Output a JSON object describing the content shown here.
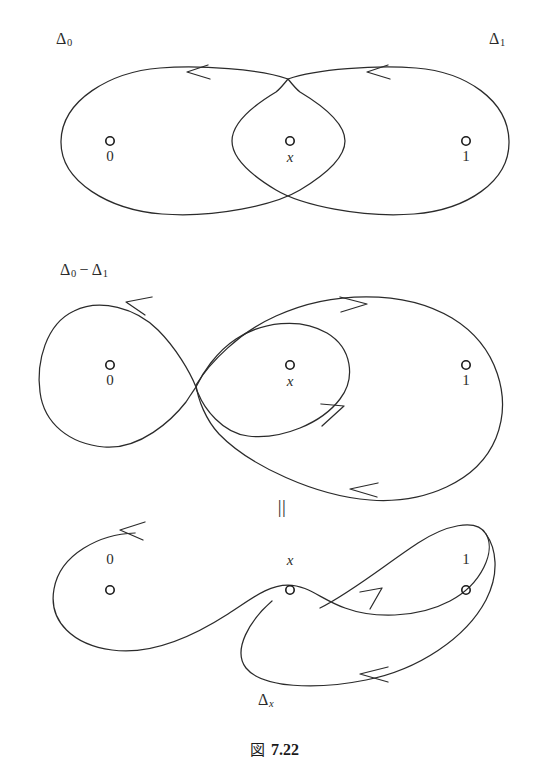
{
  "figure": {
    "caption_word": "図",
    "caption_number": "7.22",
    "equals_symbol": "||",
    "panels": [
      {
        "id": "top",
        "name": "two-overlapping-loops",
        "labels": [
          {
            "name": "delta-0-label",
            "text": "Δ",
            "sub": "0",
            "sub_italic": false,
            "x": 56,
            "y": 31
          },
          {
            "name": "delta-1-label",
            "text": "Δ",
            "sub": "1",
            "sub_italic": false,
            "x": 489,
            "y": 31
          }
        ],
        "points": [
          {
            "name": "point-0",
            "label": "0",
            "italic": false,
            "cx": 110,
            "cy": 141,
            "label_x": 110,
            "label_y": 149
          },
          {
            "name": "point-x",
            "label": "x",
            "italic": true,
            "cx": 290,
            "cy": 141,
            "label_x": 290,
            "label_y": 150
          },
          {
            "name": "point-1",
            "label": "1",
            "italic": false,
            "cx": 466,
            "cy": 141,
            "label_x": 466,
            "label_y": 149
          }
        ]
      },
      {
        "id": "middle",
        "name": "figure-eight-with-outer-loop",
        "labels": [
          {
            "name": "delta-0-minus-delta-1-label",
            "text": "Δ",
            "sub": "0",
            "minus": "−",
            "text2": "Δ",
            "sub2": "1",
            "x": 60,
            "y": 262
          }
        ],
        "points": [
          {
            "name": "point-0",
            "label": "0",
            "italic": false,
            "cx": 110,
            "cy": 365,
            "label_x": 110,
            "label_y": 373
          },
          {
            "name": "point-x",
            "label": "x",
            "italic": true,
            "cx": 290,
            "cy": 365,
            "label_x": 290,
            "label_y": 374
          },
          {
            "name": "point-1",
            "label": "1",
            "italic": false,
            "cx": 466,
            "cy": 365,
            "label_x": 466,
            "label_y": 373
          }
        ]
      },
      {
        "id": "bottom",
        "name": "single-lemniscate-loop",
        "labels": [
          {
            "name": "delta-x-label",
            "text": "Δ",
            "sub": "x",
            "sub_italic": true,
            "x": 258,
            "y": 692
          }
        ],
        "points": [
          {
            "name": "point-0",
            "label": "0",
            "italic": false,
            "cx": 110,
            "cy": 590,
            "label_x": 110,
            "label_y": 552
          },
          {
            "name": "point-x",
            "label": "x",
            "italic": true,
            "cx": 290,
            "cy": 590,
            "label_x": 290,
            "label_y": 553
          },
          {
            "name": "point-1",
            "label": "1",
            "italic": false,
            "cx": 466,
            "cy": 590,
            "label_x": 466,
            "label_y": 552
          }
        ]
      }
    ],
    "colors": {
      "stroke": "#2b2b2b",
      "text": "#1a1a1a",
      "background": "#ffffff"
    }
  }
}
